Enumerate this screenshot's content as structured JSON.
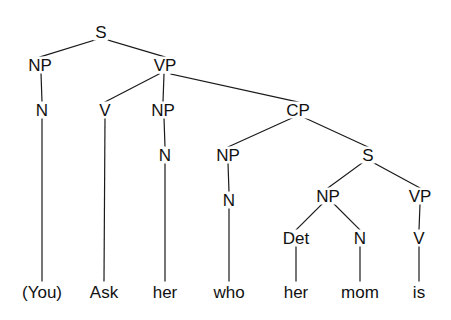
{
  "figure": {
    "type": "constituency-syntax-tree",
    "sentence": "(You) Ask her who her mom is",
    "background_color": "#ffffff",
    "line_color": "#1a1a1a",
    "text_color": "#111111"
  },
  "nodes": [
    {
      "id": "S",
      "label": "S",
      "x": 101,
      "y": 32
    },
    {
      "id": "NP1",
      "label": "NP",
      "x": 40,
      "y": 65
    },
    {
      "id": "VP1",
      "label": "VP",
      "x": 165,
      "y": 65
    },
    {
      "id": "N1",
      "label": "N",
      "x": 42,
      "y": 110
    },
    {
      "id": "V1",
      "label": "V",
      "x": 105,
      "y": 110
    },
    {
      "id": "NP2",
      "label": "NP",
      "x": 163,
      "y": 110
    },
    {
      "id": "CP",
      "label": "CP",
      "x": 298,
      "y": 110
    },
    {
      "id": "N2",
      "label": "N",
      "x": 165,
      "y": 155
    },
    {
      "id": "NP3",
      "label": "NP",
      "x": 228,
      "y": 155
    },
    {
      "id": "S2",
      "label": "S",
      "x": 368,
      "y": 155
    },
    {
      "id": "N3",
      "label": "N",
      "x": 229,
      "y": 200
    },
    {
      "id": "NP4",
      "label": "NP",
      "x": 328,
      "y": 196
    },
    {
      "id": "VP2",
      "label": "VP",
      "x": 420,
      "y": 196
    },
    {
      "id": "Det1",
      "label": "Det",
      "x": 296,
      "y": 238
    },
    {
      "id": "N4",
      "label": "N",
      "x": 360,
      "y": 238
    },
    {
      "id": "V2",
      "label": "V",
      "x": 419,
      "y": 238
    }
  ],
  "leaves": [
    {
      "id": "w1",
      "label": "(You)",
      "x": 42,
      "y": 292,
      "parent": "N1"
    },
    {
      "id": "w2",
      "label": "Ask",
      "x": 104,
      "y": 292,
      "parent": "V1"
    },
    {
      "id": "w3",
      "label": "her",
      "x": 165,
      "y": 292,
      "parent": "N2"
    },
    {
      "id": "w4",
      "label": "who",
      "x": 229,
      "y": 292,
      "parent": "N3"
    },
    {
      "id": "w5",
      "label": "her",
      "x": 296,
      "y": 292,
      "parent": "Det1"
    },
    {
      "id": "w6",
      "label": "mom",
      "x": 360,
      "y": 292,
      "parent": "N4"
    },
    {
      "id": "w7",
      "label": "is",
      "x": 419,
      "y": 292,
      "parent": "V2"
    }
  ],
  "edges": [
    {
      "from": "S",
      "to": "NP1",
      "x1": 95,
      "y1": 40,
      "x2": 40,
      "y2": 57
    },
    {
      "from": "S",
      "to": "VP1",
      "x1": 108,
      "y1": 40,
      "x2": 165,
      "y2": 57
    },
    {
      "from": "NP1",
      "to": "N1",
      "x1": 41,
      "y1": 73,
      "x2": 42,
      "y2": 102
    },
    {
      "from": "VP1",
      "to": "V1",
      "x1": 159,
      "y1": 74,
      "x2": 105,
      "y2": 102
    },
    {
      "from": "VP1",
      "to": "NP2",
      "x1": 164,
      "y1": 74,
      "x2": 163,
      "y2": 102
    },
    {
      "from": "VP1",
      "to": "CP",
      "x1": 171,
      "y1": 74,
      "x2": 298,
      "y2": 102
    },
    {
      "from": "N1",
      "to": "w1",
      "x1": 42,
      "y1": 118,
      "x2": 42,
      "y2": 281
    },
    {
      "from": "V1",
      "to": "w2",
      "x1": 105,
      "y1": 118,
      "x2": 104,
      "y2": 281
    },
    {
      "from": "NP2",
      "to": "N2",
      "x1": 164,
      "y1": 118,
      "x2": 165,
      "y2": 147
    },
    {
      "from": "N2",
      "to": "w3",
      "x1": 165,
      "y1": 163,
      "x2": 165,
      "y2": 281
    },
    {
      "from": "CP",
      "to": "NP3",
      "x1": 292,
      "y1": 118,
      "x2": 228,
      "y2": 147
    },
    {
      "from": "CP",
      "to": "S2",
      "x1": 305,
      "y1": 118,
      "x2": 368,
      "y2": 147
    },
    {
      "from": "NP3",
      "to": "N3",
      "x1": 228,
      "y1": 163,
      "x2": 229,
      "y2": 192
    },
    {
      "from": "N3",
      "to": "w4",
      "x1": 229,
      "y1": 208,
      "x2": 229,
      "y2": 281
    },
    {
      "from": "S2",
      "to": "NP4",
      "x1": 362,
      "y1": 163,
      "x2": 328,
      "y2": 188
    },
    {
      "from": "S2",
      "to": "VP2",
      "x1": 374,
      "y1": 163,
      "x2": 420,
      "y2": 188
    },
    {
      "from": "NP4",
      "to": "Det1",
      "x1": 322,
      "y1": 204,
      "x2": 296,
      "y2": 230
    },
    {
      "from": "NP4",
      "to": "N4",
      "x1": 334,
      "y1": 204,
      "x2": 360,
      "y2": 230
    },
    {
      "from": "VP2",
      "to": "V2",
      "x1": 420,
      "y1": 204,
      "x2": 419,
      "y2": 230
    },
    {
      "from": "Det1",
      "to": "w5",
      "x1": 296,
      "y1": 246,
      "x2": 296,
      "y2": 281
    },
    {
      "from": "N4",
      "to": "w6",
      "x1": 360,
      "y1": 246,
      "x2": 360,
      "y2": 281
    },
    {
      "from": "V2",
      "to": "w7",
      "x1": 419,
      "y1": 246,
      "x2": 419,
      "y2": 281
    }
  ],
  "footer": {
    "note": ""
  }
}
